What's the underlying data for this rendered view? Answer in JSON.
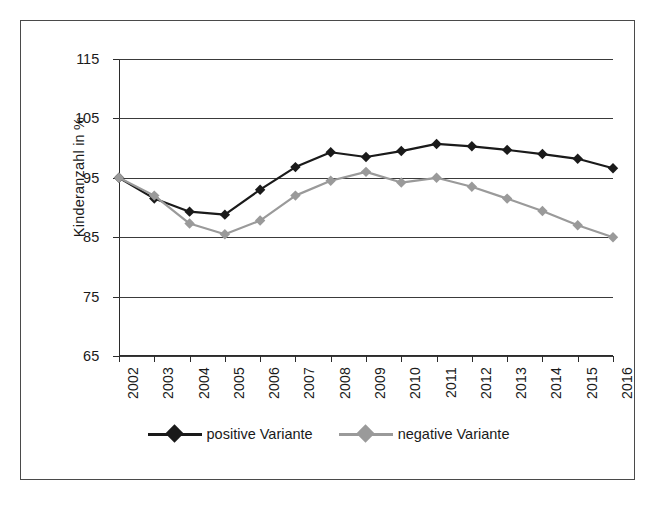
{
  "chart_data": {
    "type": "line",
    "title": "",
    "subtitle": "",
    "xlabel": "",
    "ylabel": "Kinderanzahl in %",
    "categories": [
      "2002",
      "2003",
      "2004",
      "2005",
      "2006",
      "2007",
      "2008",
      "2009",
      "2010",
      "2011",
      "2012",
      "2013",
      "2014",
      "2015",
      "2016"
    ],
    "ylim": [
      65,
      115
    ],
    "yticks": [
      65,
      75,
      85,
      95,
      105,
      115
    ],
    "grid": "horizontal",
    "legend_position": "bottom-center",
    "series": [
      {
        "name": "positive Variante",
        "color": "#1a1a1a",
        "marker": "diamond",
        "values": [
          95.0,
          91.5,
          89.3,
          88.8,
          93.0,
          96.8,
          99.3,
          98.5,
          99.5,
          100.7,
          100.3,
          99.7,
          99.0,
          98.2,
          96.6
        ]
      },
      {
        "name": "negative Variante",
        "color": "#9a9a9a",
        "marker": "diamond",
        "values": [
          95.0,
          92.0,
          87.3,
          85.5,
          87.8,
          92.0,
          94.5,
          96.0,
          94.2,
          95.0,
          93.5,
          91.5,
          89.4,
          87.0,
          85.0
        ]
      }
    ]
  },
  "legend": {
    "entries": [
      {
        "label": "positive Variante"
      },
      {
        "label": "negative Variante"
      }
    ]
  }
}
